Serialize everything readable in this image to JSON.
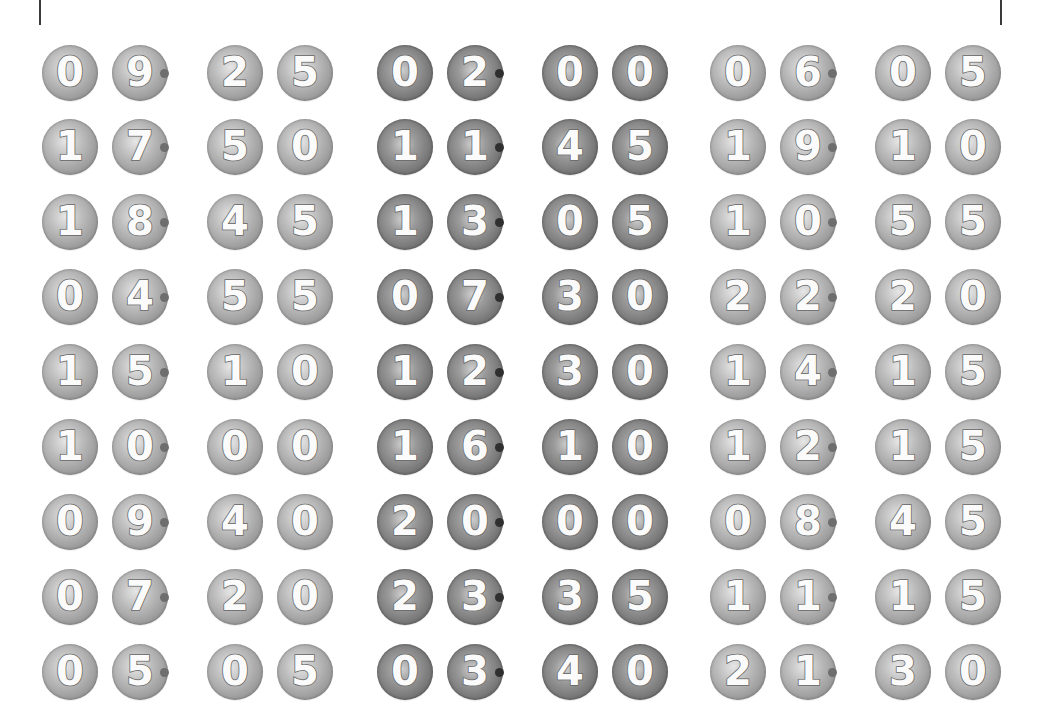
{
  "page": {
    "background": "#ffffff",
    "edge_line_color": "#3a3a3a"
  },
  "style": {
    "ball_light_color": "#a8a8a8",
    "ball_dark_color": "#7a7a7a",
    "digit_color": "#ffffff",
    "dot_light_color": "#6e6e6e",
    "dot_dark_color": "#2f2f2f"
  },
  "groups": [
    {
      "tone": "light",
      "times": [
        {
          "h1": "0",
          "h2": "9",
          "sep": "·",
          "m1": "2",
          "m2": "5",
          "label": "09·25"
        },
        {
          "h1": "1",
          "h2": "7",
          "sep": "·",
          "m1": "5",
          "m2": "0",
          "label": "17·50"
        },
        {
          "h1": "1",
          "h2": "8",
          "sep": "·",
          "m1": "4",
          "m2": "5",
          "label": "18·45"
        },
        {
          "h1": "0",
          "h2": "4",
          "sep": "·",
          "m1": "5",
          "m2": "5",
          "label": "04·55"
        },
        {
          "h1": "1",
          "h2": "5",
          "sep": "·",
          "m1": "1",
          "m2": "0",
          "label": "15·10"
        },
        {
          "h1": "1",
          "h2": "0",
          "sep": "·",
          "m1": "0",
          "m2": "0",
          "label": "10·00"
        },
        {
          "h1": "0",
          "h2": "9",
          "sep": "·",
          "m1": "4",
          "m2": "0",
          "label": "09·40"
        },
        {
          "h1": "0",
          "h2": "7",
          "sep": "·",
          "m1": "2",
          "m2": "0",
          "label": "07·20"
        },
        {
          "h1": "0",
          "h2": "5",
          "sep": "·",
          "m1": "0",
          "m2": "5",
          "label": "05·05"
        }
      ]
    },
    {
      "tone": "dark",
      "times": [
        {
          "h1": "0",
          "h2": "2",
          "sep": "·",
          "m1": "0",
          "m2": "0",
          "label": "02·00"
        },
        {
          "h1": "1",
          "h2": "1",
          "sep": "·",
          "m1": "4",
          "m2": "5",
          "label": "11·45"
        },
        {
          "h1": "1",
          "h2": "3",
          "sep": "·",
          "m1": "0",
          "m2": "5",
          "label": "13·05"
        },
        {
          "h1": "0",
          "h2": "7",
          "sep": "·",
          "m1": "3",
          "m2": "0",
          "label": "07·30"
        },
        {
          "h1": "1",
          "h2": "2",
          "sep": "·",
          "m1": "3",
          "m2": "0",
          "label": "12·30"
        },
        {
          "h1": "1",
          "h2": "6",
          "sep": "·",
          "m1": "1",
          "m2": "0",
          "label": "16·10"
        },
        {
          "h1": "2",
          "h2": "0",
          "sep": "·",
          "m1": "0",
          "m2": "0",
          "label": "20·00"
        },
        {
          "h1": "2",
          "h2": "3",
          "sep": "·",
          "m1": "3",
          "m2": "5",
          "label": "23·35"
        },
        {
          "h1": "0",
          "h2": "3",
          "sep": "·",
          "m1": "4",
          "m2": "0",
          "label": "03·40"
        }
      ]
    },
    {
      "tone": "light",
      "times": [
        {
          "h1": "0",
          "h2": "6",
          "sep": "·",
          "m1": "0",
          "m2": "5",
          "label": "06·05"
        },
        {
          "h1": "1",
          "h2": "9",
          "sep": "·",
          "m1": "1",
          "m2": "0",
          "label": "19·10"
        },
        {
          "h1": "1",
          "h2": "0",
          "sep": "·",
          "m1": "5",
          "m2": "5",
          "label": "10·55"
        },
        {
          "h1": "2",
          "h2": "2",
          "sep": "·",
          "m1": "2",
          "m2": "0",
          "label": "22·20"
        },
        {
          "h1": "1",
          "h2": "4",
          "sep": "·",
          "m1": "1",
          "m2": "5",
          "label": "14·15"
        },
        {
          "h1": "1",
          "h2": "2",
          "sep": "·",
          "m1": "1",
          "m2": "5",
          "label": "12·15"
        },
        {
          "h1": "0",
          "h2": "8",
          "sep": "·",
          "m1": "4",
          "m2": "5",
          "label": "08·45"
        },
        {
          "h1": "1",
          "h2": "1",
          "sep": "·",
          "m1": "1",
          "m2": "5",
          "label": "11·15"
        },
        {
          "h1": "2",
          "h2": "1",
          "sep": "·",
          "m1": "3",
          "m2": "0",
          "label": "21·30"
        }
      ]
    }
  ]
}
